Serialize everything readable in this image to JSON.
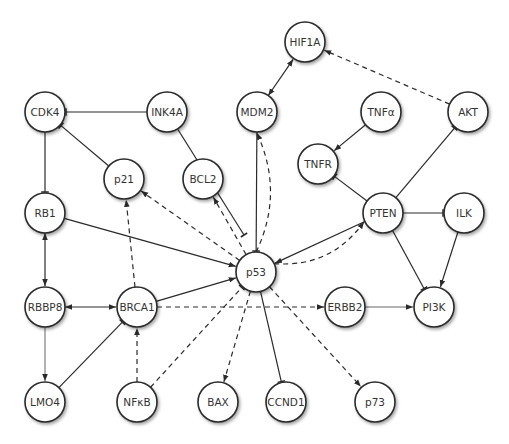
{
  "diagram": {
    "node_radius": 20,
    "nodes": [
      {
        "id": "HIF1A",
        "label": "HIF1A",
        "x": 305,
        "y": 42
      },
      {
        "id": "CDK4",
        "label": "CDK4",
        "x": 45,
        "y": 112
      },
      {
        "id": "INK4A",
        "label": "INK4A",
        "x": 167,
        "y": 112
      },
      {
        "id": "MDM2",
        "label": "MDM2",
        "x": 257,
        "y": 112
      },
      {
        "id": "TNFa",
        "label": "TNFα",
        "x": 381,
        "y": 112
      },
      {
        "id": "AKT",
        "label": "AKT",
        "x": 468,
        "y": 112
      },
      {
        "id": "p21",
        "label": "p21",
        "x": 124,
        "y": 179
      },
      {
        "id": "BCL2",
        "label": "BCL2",
        "x": 203,
        "y": 179
      },
      {
        "id": "TNFR",
        "label": "TNFR",
        "x": 318,
        "y": 164
      },
      {
        "id": "PTEN",
        "label": "PTEN",
        "x": 383,
        "y": 213
      },
      {
        "id": "ILK",
        "label": "ILK",
        "x": 464,
        "y": 213
      },
      {
        "id": "RB1",
        "label": "RB1",
        "x": 45,
        "y": 213
      },
      {
        "id": "p53",
        "label": "p53",
        "x": 256,
        "y": 272
      },
      {
        "id": "RBBP8",
        "label": "RBBP8",
        "x": 45,
        "y": 307
      },
      {
        "id": "BRCA1",
        "label": "BRCA1",
        "x": 137,
        "y": 307
      },
      {
        "id": "ERBB2",
        "label": "ERBB2",
        "x": 345,
        "y": 307
      },
      {
        "id": "PI3K",
        "label": "PI3K",
        "x": 434,
        "y": 307
      },
      {
        "id": "LMO4",
        "label": "LMO4",
        "x": 45,
        "y": 402
      },
      {
        "id": "NFkB",
        "label": "NFκB",
        "x": 137,
        "y": 402
      },
      {
        "id": "BAX",
        "label": "BAX",
        "x": 218,
        "y": 402
      },
      {
        "id": "CCND1",
        "label": "CCND1",
        "x": 286,
        "y": 402
      },
      {
        "id": "p73",
        "label": "p73",
        "x": 375,
        "y": 402
      }
    ],
    "edges": [
      {
        "from": "MDM2",
        "to": "HIF1A",
        "type": "activate",
        "style": "solid",
        "bidirectional": true
      },
      {
        "from": "AKT",
        "to": "HIF1A",
        "type": "activate",
        "style": "dashed"
      },
      {
        "from": "INK4A",
        "to": "CDK4",
        "type": "inhibit",
        "style": "solid"
      },
      {
        "from": "INK4A",
        "to": "p53",
        "type": "inhibit",
        "style": "solid",
        "endAt": [
          244,
          235
        ]
      },
      {
        "from": "p21",
        "to": "CDK4",
        "type": "inhibit",
        "style": "solid"
      },
      {
        "from": "CDK4",
        "to": "RB1",
        "type": "inhibit",
        "style": "solid"
      },
      {
        "from": "MDM2",
        "to": "p53",
        "type": "inhibit",
        "style": "solid"
      },
      {
        "from": "p53",
        "to": "MDM2",
        "type": "activate",
        "style": "dashed",
        "curve": true
      },
      {
        "from": "TNFa",
        "to": "TNFR",
        "type": "activate",
        "style": "solid"
      },
      {
        "from": "PTEN",
        "to": "TNFR",
        "type": "inhibit",
        "style": "solid"
      },
      {
        "from": "PTEN",
        "to": "AKT",
        "type": "inhibit",
        "style": "solid"
      },
      {
        "from": "PTEN",
        "to": "ILK",
        "type": "inhibit",
        "style": "solid"
      },
      {
        "from": "PTEN",
        "to": "PI3K",
        "type": "inhibit",
        "style": "solid"
      },
      {
        "from": "ILK",
        "to": "PI3K",
        "type": "activate",
        "style": "solid"
      },
      {
        "from": "PTEN",
        "to": "p53",
        "type": "activate",
        "style": "solid"
      },
      {
        "from": "p53",
        "to": "PTEN",
        "type": "activate",
        "style": "dashed",
        "curve": true
      },
      {
        "from": "RB1",
        "to": "p53",
        "type": "activate",
        "style": "solid"
      },
      {
        "from": "RB1",
        "to": "RBBP8",
        "type": "activate",
        "style": "solid",
        "bidirectional": true
      },
      {
        "from": "RBBP8",
        "to": "BRCA1",
        "type": "activate",
        "style": "solid",
        "bidirectional": true
      },
      {
        "from": "RBBP8",
        "to": "LMO4",
        "type": "activate",
        "style": "thin"
      },
      {
        "from": "LMO4",
        "to": "BRCA1",
        "type": "inhibit",
        "style": "solid"
      },
      {
        "from": "BRCA1",
        "to": "p53",
        "type": "activate",
        "style": "solid"
      },
      {
        "from": "BRCA1",
        "to": "p21",
        "type": "activate",
        "style": "dashed"
      },
      {
        "from": "BRCA1",
        "to": "ERBB2",
        "type": "activate",
        "style": "dashed"
      },
      {
        "from": "NFkB",
        "to": "BRCA1",
        "type": "activate",
        "style": "dashed"
      },
      {
        "from": "NFkB",
        "to": "p53",
        "type": "inhibit",
        "style": "dashed"
      },
      {
        "from": "p53",
        "to": "p21",
        "type": "activate",
        "style": "dashed"
      },
      {
        "from": "p53",
        "to": "BCL2",
        "type": "activate",
        "style": "dashed"
      },
      {
        "from": "p53",
        "to": "BAX",
        "type": "activate",
        "style": "dashed"
      },
      {
        "from": "p53",
        "to": "CCND1",
        "type": "inhibit",
        "style": "solid"
      },
      {
        "from": "p53",
        "to": "p73",
        "type": "activate",
        "style": "dashed"
      },
      {
        "from": "ERBB2",
        "to": "PI3K",
        "type": "activate",
        "style": "thin"
      }
    ]
  }
}
